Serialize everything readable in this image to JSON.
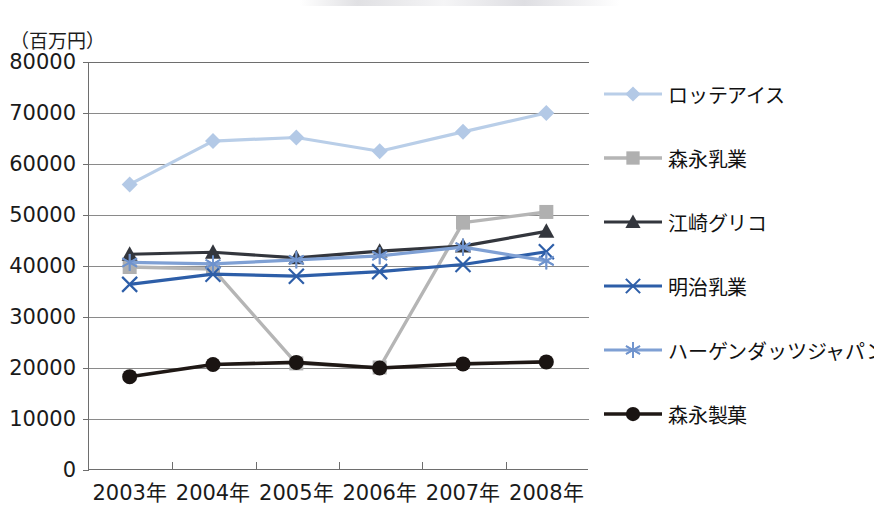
{
  "chart_data": {
    "type": "line",
    "title": "",
    "subtitle": "",
    "xlabel": "",
    "ylabel": "（百万円）",
    "unit_label": "（百万円）",
    "categories": [
      "2003年",
      "2004年",
      "2005年",
      "2006年",
      "2007年",
      "2008年"
    ],
    "ytick_labels": [
      "80000",
      "70000",
      "60000",
      "50000",
      "40000",
      "30000",
      "20000",
      "10000",
      "0"
    ],
    "ytick_values": [
      80000,
      70000,
      60000,
      50000,
      40000,
      30000,
      20000,
      10000,
      0
    ],
    "ylim": [
      0,
      80000
    ],
    "grid": true,
    "grid_axis": "y",
    "legend_position": "right",
    "series": [
      {
        "name": "ロッテアイス",
        "marker": "diamond",
        "color": "#b3c9e6",
        "line_color": "#b9cee8",
        "values": [
          56000,
          64500,
          65200,
          62500,
          66300,
          70000
        ]
      },
      {
        "name": "森永乳業",
        "marker": "square",
        "color": "#b0b0b0",
        "line_color": "#b5b5b5",
        "values": [
          39800,
          39400,
          20900,
          20100,
          48500,
          50600
        ]
      },
      {
        "name": "江崎グリコ",
        "marker": "triangle",
        "color": "#33363d",
        "line_color": "#33363d",
        "values": [
          42300,
          42700,
          41600,
          42900,
          43900,
          46800
        ]
      },
      {
        "name": "明治乳業",
        "marker": "x",
        "color": "#2d5ea8",
        "line_color": "#2d5ea8",
        "values": [
          36400,
          38400,
          38000,
          38900,
          40300,
          42800
        ]
      },
      {
        "name": "ハーゲンダッツジャパン",
        "marker": "asterisk",
        "color": "#6f93cd",
        "line_color": "#7fa0d4",
        "values": [
          40700,
          40400,
          41200,
          42000,
          43700,
          41000
        ]
      },
      {
        "name": "森永製菓",
        "marker": "circle",
        "color": "#1a1412",
        "line_color": "#1f1815",
        "values": [
          18300,
          20700,
          21100,
          20000,
          20800,
          21200
        ]
      }
    ]
  },
  "legend": {
    "items": [
      {
        "label": "ロッテアイス"
      },
      {
        "label": "森永乳業"
      },
      {
        "label": "江崎グリコ"
      },
      {
        "label": "明治乳業"
      },
      {
        "label": "ハーゲンダッツジャパン"
      },
      {
        "label": "森永製菓"
      }
    ]
  },
  "colors": {
    "axis": "#6e6e6e",
    "grid": "#8a8a8a",
    "text": "#1a1a1a",
    "background": "#ffffff"
  }
}
